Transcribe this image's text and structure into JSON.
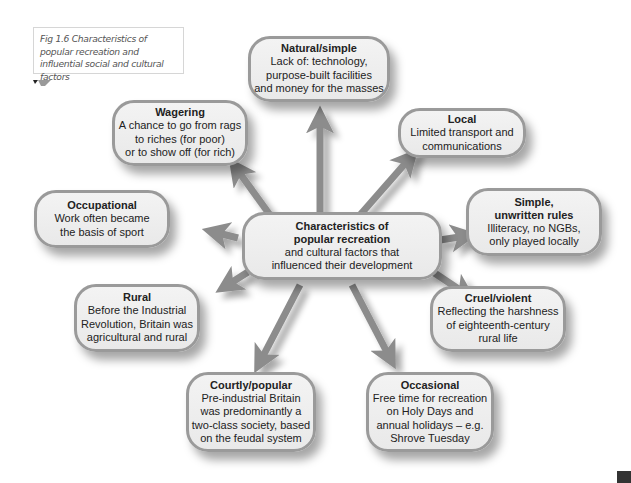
{
  "figure": {
    "caption": "Fig 1.6 Characteristics of popular recreation and influential social and cultural factors"
  },
  "center": {
    "title_line1": "Characteristics of",
    "title_line2": "popular recreation",
    "body_line1": "and cultural factors that",
    "body_line2": "influenced their development"
  },
  "nodes": [
    {
      "id": "natural",
      "title": "Natural/simple",
      "lines": [
        "Lack of: technology,",
        "purpose-built facilities",
        "and money for the masses"
      ]
    },
    {
      "id": "local",
      "title": "Local",
      "lines": [
        "Limited transport and",
        "communications"
      ]
    },
    {
      "id": "simple",
      "title": "Simple,",
      "title2": "unwritten rules",
      "lines": [
        "Illiteracy, no NGBs,",
        "only played locally"
      ]
    },
    {
      "id": "cruel",
      "title": "Cruel/violent",
      "lines": [
        "Reflecting the harshness",
        "of eighteenth-century",
        "rural life"
      ]
    },
    {
      "id": "occasional",
      "title": "Occasional",
      "lines": [
        "Free time for recreation",
        "on Holy Days and",
        "annual holidays – e.g.",
        "Shrove Tuesday"
      ]
    },
    {
      "id": "courtly",
      "title": "Courtly/popular",
      "lines": [
        "Pre-industrial Britain",
        "was predominantly a",
        "two-class society, based",
        "on the feudal system"
      ]
    },
    {
      "id": "rural",
      "title": "Rural",
      "lines": [
        "Before the Industrial",
        "Revolution, Britain was",
        "agricultural and rural"
      ]
    },
    {
      "id": "occupational",
      "title": "Occupational",
      "lines": [
        "Work often became",
        "the basis of sport"
      ]
    },
    {
      "id": "wagering",
      "title": "Wagering",
      "lines": [
        "A chance to go from rags",
        "to riches (for poor)",
        "or to show off (for rich)"
      ]
    }
  ],
  "colors": {
    "node_fill": "#eeeeee",
    "node_border": "#9a9a9a",
    "arrow": "#8c8c8c",
    "text": "#222222",
    "caption_text": "#555555"
  }
}
